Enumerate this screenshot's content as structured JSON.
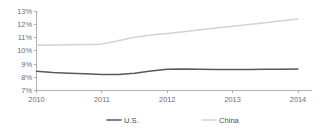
{
  "chart_data": {
    "type": "line",
    "title": "",
    "subtitle": "",
    "xlabel": "",
    "ylabel": "",
    "x": [
      2010,
      2011,
      2012,
      2013,
      2014
    ],
    "categories": [
      "2010",
      "2011",
      "2012",
      "2013",
      "2014"
    ],
    "xtick_labels": [
      "2010",
      "2011",
      "2012",
      "2013",
      "2014"
    ],
    "ytick_labels": [
      "13%",
      "12%",
      "11%",
      "10%",
      "9%",
      "8%",
      "7%"
    ],
    "ytick_values": [
      13,
      12,
      11,
      10,
      9,
      8,
      7
    ],
    "ylim": [
      7,
      13
    ],
    "xlim": [
      2010,
      2014
    ],
    "y_unit": "%",
    "grid": false,
    "legend_position": "bottom-center",
    "series": [
      {
        "name": "U.S.",
        "color": "#58595b",
        "stroke_width": 1.5,
        "values": [
          8.45,
          8.2,
          8.6,
          8.6,
          8.62
        ],
        "dense_x": [
          2010.0,
          2010.25,
          2010.5,
          2010.75,
          2011.0,
          2011.25,
          2011.5,
          2011.75,
          2012.0,
          2012.25,
          2012.5,
          2012.75,
          2013.0,
          2013.25,
          2013.5,
          2013.75,
          2014.0
        ],
        "dense_values": [
          8.45,
          8.36,
          8.3,
          8.26,
          8.2,
          8.2,
          8.3,
          8.47,
          8.6,
          8.62,
          8.6,
          8.59,
          8.59,
          8.59,
          8.6,
          8.61,
          8.62
        ]
      },
      {
        "name": "China",
        "color": "#d1d3d4",
        "stroke_width": 1.5,
        "values": [
          10.42,
          10.5,
          11.3,
          11.85,
          12.4
        ],
        "dense_x": [
          2010.0,
          2010.25,
          2010.5,
          2010.75,
          2011.0,
          2011.25,
          2011.5,
          2011.75,
          2012.0,
          2012.25,
          2012.5,
          2012.75,
          2013.0,
          2013.25,
          2013.5,
          2013.75,
          2014.0
        ],
        "dense_values": [
          10.42,
          10.44,
          10.46,
          10.47,
          10.5,
          10.75,
          11.02,
          11.18,
          11.3,
          11.44,
          11.58,
          11.72,
          11.85,
          11.98,
          12.12,
          12.26,
          12.4
        ]
      }
    ],
    "legend": [
      {
        "label": "U.S.",
        "color": "#58595b",
        "stroke_width": 1.6
      },
      {
        "label": "China",
        "color": "#d1d3d4",
        "stroke_width": 1.6
      }
    ],
    "colors": {
      "background": "#ffffff",
      "axis": "#a7a9ac",
      "tick_label": "#6d6e71",
      "us_series": "#58595b",
      "china_series": "#d1d3d4"
    }
  }
}
